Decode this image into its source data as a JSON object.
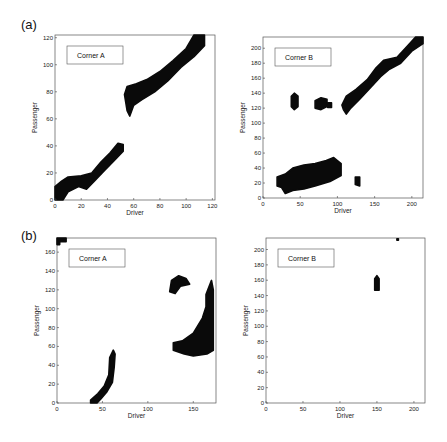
{
  "figure": {
    "panel_labels": [
      "(a)",
      "(b)"
    ]
  },
  "chart_data": [
    {
      "id": "a-cornerA",
      "panel": "(a)",
      "type": "scatter",
      "title": "Corner A",
      "legend": "Corner A",
      "xlabel": "Driver",
      "ylabel": "Passenger",
      "xlim": [
        0,
        122
      ],
      "ylim": [
        0,
        122
      ],
      "xticks": [
        0,
        20,
        40,
        60,
        80,
        100,
        120
      ],
      "yticks": [
        0,
        20,
        40,
        60,
        80,
        100,
        120
      ],
      "frame": {
        "x0": 55,
        "y0": 35,
        "x1": 215,
        "y1": 200
      },
      "regions": [
        {
          "desc": "lower diagonal band",
          "points": [
            [
              0,
              0
            ],
            [
              0,
              10
            ],
            [
              5,
              14
            ],
            [
              10,
              17
            ],
            [
              20,
              18
            ],
            [
              28,
              20
            ],
            [
              35,
              28
            ],
            [
              42,
              35
            ],
            [
              48,
              42
            ],
            [
              52,
              41
            ],
            [
              52,
              36
            ],
            [
              46,
              30
            ],
            [
              38,
              22
            ],
            [
              30,
              14
            ],
            [
              24,
              8
            ],
            [
              18,
              10
            ],
            [
              10,
              6
            ],
            [
              6,
              0
            ]
          ]
        },
        {
          "desc": "upper diagonal band",
          "points": [
            [
              53,
              78
            ],
            [
              55,
              84
            ],
            [
              62,
              86
            ],
            [
              70,
              89
            ],
            [
              80,
              95
            ],
            [
              90,
              103
            ],
            [
              100,
              112
            ],
            [
              106,
              122
            ],
            [
              114,
              122
            ],
            [
              114,
              114
            ],
            [
              106,
              106
            ],
            [
              96,
              98
            ],
            [
              86,
              88
            ],
            [
              76,
              80
            ],
            [
              66,
              74
            ],
            [
              60,
              70
            ],
            [
              57,
              62
            ],
            [
              55,
              66
            ]
          ]
        }
      ]
    },
    {
      "id": "a-cornerB",
      "panel": "(a)",
      "type": "scatter",
      "title": "Corner B",
      "legend": "Corner B",
      "xlabel": "Driver",
      "ylabel": "Passenger",
      "xlim": [
        0,
        215
      ],
      "ylim": [
        0,
        215
      ],
      "xticks": [
        0,
        50,
        100,
        150,
        200
      ],
      "yticks": [
        0,
        20,
        40,
        60,
        80,
        100,
        120,
        140,
        160,
        180,
        200
      ],
      "frame": {
        "x0": 263,
        "y0": 37,
        "x1": 423,
        "y1": 198
      },
      "regions": [
        {
          "desc": "diagonal band",
          "points": [
            [
              106,
              124
            ],
            [
              112,
              136
            ],
            [
              125,
              145
            ],
            [
              140,
              158
            ],
            [
              152,
              174
            ],
            [
              162,
              184
            ],
            [
              180,
              188
            ],
            [
              195,
              204
            ],
            [
              205,
              215
            ],
            [
              215,
              215
            ],
            [
              215,
              206
            ],
            [
              200,
              196
            ],
            [
              185,
              180
            ],
            [
              170,
              172
            ],
            [
              158,
              162
            ],
            [
              145,
              148
            ],
            [
              130,
              132
            ],
            [
              118,
              120
            ],
            [
              112,
              112
            ],
            [
              108,
              118
            ]
          ]
        },
        {
          "desc": "cluster near (42,130)",
          "points": [
            [
              38,
              122
            ],
            [
              38,
              136
            ],
            [
              42,
              140
            ],
            [
              47,
              136
            ],
            [
              47,
              122
            ],
            [
              42,
              118
            ]
          ]
        },
        {
          "desc": "cluster near (78,126)",
          "points": [
            [
              70,
              120
            ],
            [
              70,
              130
            ],
            [
              78,
              134
            ],
            [
              86,
              132
            ],
            [
              86,
              122
            ],
            [
              78,
              118
            ]
          ]
        },
        {
          "desc": "small blob near (90,124)",
          "points": [
            [
              87,
              121
            ],
            [
              87,
              127
            ],
            [
              92,
              127
            ],
            [
              92,
              121
            ]
          ]
        },
        {
          "desc": "lower horizontal band",
          "points": [
            [
              19,
              16
            ],
            [
              19,
              28
            ],
            [
              30,
              32
            ],
            [
              40,
              40
            ],
            [
              55,
              44
            ],
            [
              70,
              46
            ],
            [
              85,
              50
            ],
            [
              95,
              54
            ],
            [
              105,
              46
            ],
            [
              105,
              30
            ],
            [
              90,
              22
            ],
            [
              70,
              16
            ],
            [
              55,
              12
            ],
            [
              40,
              10
            ],
            [
              30,
              6
            ],
            [
              25,
              14
            ]
          ]
        },
        {
          "desc": "small blob near (127,22)",
          "points": [
            [
              124,
              18
            ],
            [
              124,
              28
            ],
            [
              130,
              28
            ],
            [
              130,
              16
            ]
          ]
        }
      ]
    },
    {
      "id": "b-cornerA",
      "panel": "(b)",
      "type": "scatter",
      "title": "Corner A",
      "legend": "Corner A",
      "xlabel": "Driver",
      "ylabel": "Passenger",
      "xlim": [
        0,
        175
      ],
      "ylim": [
        0,
        175
      ],
      "xticks": [
        0,
        50,
        100,
        150
      ],
      "yticks": [
        0,
        20,
        40,
        60,
        80,
        100,
        120,
        140,
        160
      ],
      "frame": {
        "x0": 57,
        "y0": 238,
        "x1": 216,
        "y1": 403
      },
      "regions": [
        {
          "desc": "corner blob top-left",
          "points": [
            [
              0,
              168
            ],
            [
              0,
              175
            ],
            [
              10,
              175
            ],
            [
              10,
              171
            ],
            [
              3,
              171
            ],
            [
              3,
              168
            ]
          ]
        },
        {
          "desc": "lower steep band",
          "points": [
            [
              37,
              0
            ],
            [
              37,
              3
            ],
            [
              45,
              10
            ],
            [
              52,
              18
            ],
            [
              57,
              30
            ],
            [
              58,
              48
            ],
            [
              62,
              56
            ],
            [
              64,
              52
            ],
            [
              63,
              38
            ],
            [
              61,
              22
            ],
            [
              55,
              12
            ],
            [
              48,
              4
            ],
            [
              44,
              0
            ]
          ]
        },
        {
          "desc": "upper blob near (130,125)",
          "points": [
            [
              124,
              118
            ],
            [
              126,
              130
            ],
            [
              134,
              135
            ],
            [
              142,
              132
            ],
            [
              146,
              126
            ],
            [
              136,
              124
            ],
            [
              130,
              116
            ]
          ]
        },
        {
          "desc": "right vertical band + mass",
          "points": [
            [
              128,
              56
            ],
            [
              128,
              64
            ],
            [
              138,
              66
            ],
            [
              150,
              74
            ],
            [
              160,
              90
            ],
            [
              164,
              102
            ],
            [
              164,
              115
            ],
            [
              166,
              120
            ],
            [
              170,
              130
            ],
            [
              172,
              120
            ],
            [
              172,
              56
            ],
            [
              165,
              52
            ],
            [
              150,
              50
            ],
            [
              140,
              52
            ]
          ]
        }
      ]
    },
    {
      "id": "b-cornerB",
      "panel": "(b)",
      "type": "scatter",
      "title": "Corner B",
      "legend": "Corner B",
      "xlabel": "Driver",
      "ylabel": "Passenger",
      "xlim": [
        0,
        215
      ],
      "ylim": [
        0,
        215
      ],
      "xticks": [
        0,
        50,
        100,
        150,
        200
      ],
      "yticks": [
        0,
        20,
        40,
        60,
        80,
        100,
        120,
        140,
        160,
        180,
        200
      ],
      "frame": {
        "x0": 266,
        "y0": 238,
        "x1": 425,
        "y1": 403
      },
      "regions": [
        {
          "desc": "small vertical blob near (150,157)",
          "points": [
            [
              147,
              147
            ],
            [
              147,
              162
            ],
            [
              150,
              166
            ],
            [
              153,
              162
            ],
            [
              153,
              147
            ]
          ]
        },
        {
          "desc": "dot near (178,213)",
          "points": [
            [
              177,
              212
            ],
            [
              177,
              214
            ],
            [
              179,
              214
            ],
            [
              179,
              212
            ]
          ]
        }
      ]
    }
  ]
}
